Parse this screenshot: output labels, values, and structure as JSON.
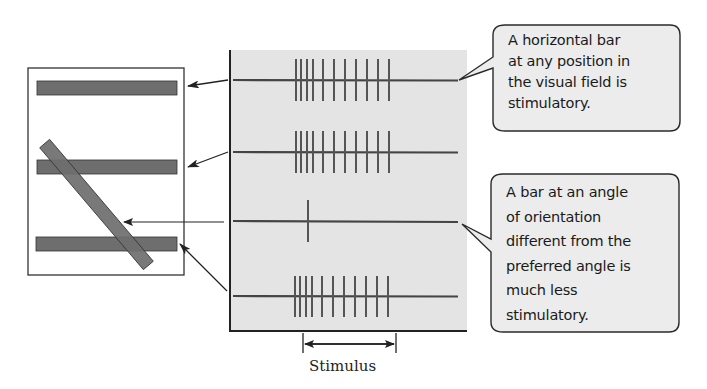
{
  "diagram": {
    "visual_field": {
      "bars": [
        {
          "id": "top",
          "orientation": "horizontal"
        },
        {
          "id": "middle",
          "orientation": "horizontal"
        },
        {
          "id": "diagonal",
          "orientation": "oblique"
        },
        {
          "id": "bottom",
          "orientation": "horizontal"
        }
      ]
    },
    "traces": [
      {
        "stimulus": "horizontal bar (top)",
        "spike_count": 11
      },
      {
        "stimulus": "horizontal bar (middle)",
        "spike_count": 11
      },
      {
        "stimulus": "oblique bar",
        "spike_count": 1
      },
      {
        "stimulus": "horizontal bar (bottom)",
        "spike_count": 11
      }
    ],
    "callouts": [
      {
        "lines": [
          "A horizontal bar",
          "at any position in",
          "the visual field is",
          "stimulatory."
        ]
      },
      {
        "lines": [
          "A bar at an angle",
          "of orientation",
          "different from the",
          "preferred angle is",
          "much less",
          "stimulatory."
        ]
      }
    ],
    "stimulus_label": "Stimulus",
    "colors": {
      "panel": "#e4e4e4",
      "bar_fill": "#6e6e6e",
      "line": "#333333",
      "callout_fill": "#ececec"
    }
  }
}
